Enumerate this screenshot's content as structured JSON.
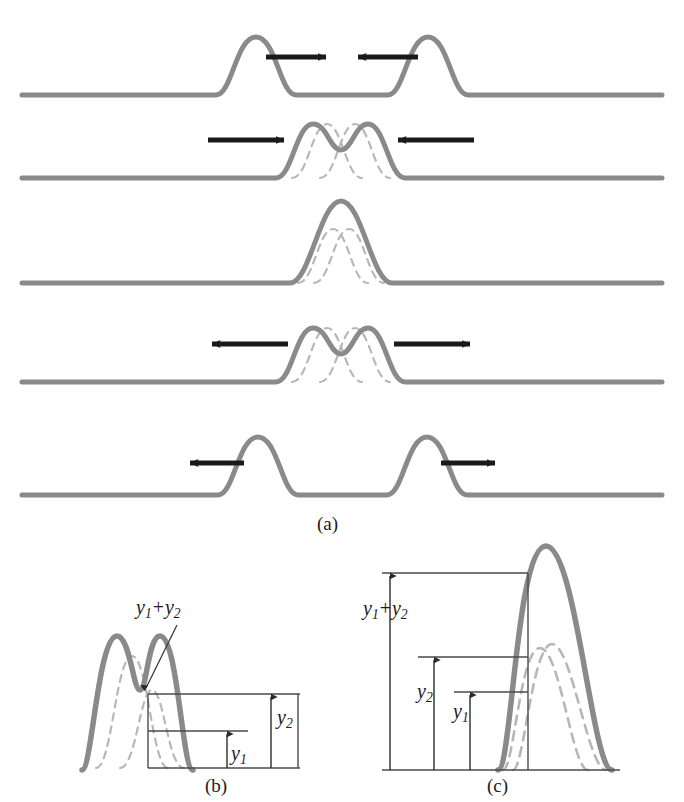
{
  "figure": {
    "colors": {
      "pulse": "#8a8a8a",
      "pulse_dashed": "#b3b3b3",
      "arrow": "#1a1a1a",
      "measure_line": "#4a4a4a",
      "text": "#1b1b1b",
      "background": "#ffffff"
    }
  },
  "panels": [
    {
      "id": "a",
      "label": "(a)",
      "caption_label": "(a)",
      "rows": [
        {
          "index": 1,
          "description": "Two separate pulses approaching each other",
          "baseline_y": 95,
          "pulses": [
            {
              "center": 256,
              "height": 58,
              "width": 62,
              "sign": "up"
            },
            {
              "center": 428,
              "height": 58,
              "width": 62,
              "sign": "up"
            }
          ],
          "arrows": [
            {
              "direction": "right",
              "x1": 266,
              "x2": 330,
              "y": 57
            },
            {
              "direction": "left",
              "x1": 418,
              "x2": 354,
              "y": 57
            }
          ],
          "ghost_pulses": []
        },
        {
          "index": 2,
          "description": "Pulses beginning to overlap; resultant has two humps",
          "baseline_y": 178,
          "pulses": [
            {
              "center": 313,
              "height": 54,
              "width": 58,
              "sign": "up"
            },
            {
              "center": 368,
              "height": 54,
              "width": 58,
              "sign": "up"
            }
          ],
          "arrows": [
            {
              "direction": "right",
              "x1": 208,
              "x2": 288,
              "y": 140
            },
            {
              "direction": "left",
              "x1": 474,
              "x2": 394,
              "y": 140
            }
          ],
          "ghost_pulses": [
            {
              "center": 327,
              "height": 54,
              "width": 58
            },
            {
              "center": 355,
              "height": 54,
              "width": 58
            }
          ]
        },
        {
          "index": 3,
          "description": "Pulses fully overlapped; resultant amplitude is the sum",
          "baseline_y": 283,
          "pulses": [
            {
              "center": 341,
              "height": 82,
              "width": 66,
              "sign": "up"
            }
          ],
          "arrows": [],
          "ghost_pulses": [
            {
              "center": 333,
              "height": 54,
              "width": 58
            },
            {
              "center": 349,
              "height": 54,
              "width": 58
            }
          ]
        },
        {
          "index": 4,
          "description": "Pulses separating again; resultant has two humps",
          "baseline_y": 382,
          "pulses": [
            {
              "center": 313,
              "height": 54,
              "width": 58,
              "sign": "up"
            },
            {
              "center": 368,
              "height": 54,
              "width": 58,
              "sign": "up"
            }
          ],
          "arrows": [
            {
              "direction": "left",
              "x1": 288,
              "x2": 208,
              "y": 344
            },
            {
              "direction": "right",
              "x1": 394,
              "x2": 474,
              "y": 344
            }
          ],
          "ghost_pulses": [
            {
              "center": 327,
              "height": 54,
              "width": 58
            },
            {
              "center": 355,
              "height": 54,
              "width": 58
            }
          ]
        },
        {
          "index": 5,
          "description": "Pulses have passed through one another, moving apart",
          "baseline_y": 495,
          "pulses": [
            {
              "center": 258,
              "height": 58,
              "width": 62,
              "sign": "up"
            },
            {
              "center": 427,
              "height": 58,
              "width": 62,
              "sign": "up"
            }
          ],
          "arrows": [
            {
              "direction": "left",
              "x1": 244,
              "x2": 186,
              "y": 463
            },
            {
              "direction": "right",
              "x1": 441,
              "x2": 499,
              "y": 463
            }
          ],
          "ghost_pulses": []
        }
      ]
    },
    {
      "id": "b",
      "label": "(b)",
      "caption_label": "(b)",
      "description": "Partially overlapping pulses; resultant displacement in the valley equals y1 + y2",
      "baseline_y": 768,
      "labels": {
        "sum": {
          "y": "y",
          "sub": "1",
          "op": "+",
          "y_b": "y",
          "sub_b": "2"
        },
        "y2": {
          "y": "y",
          "sub": "2"
        },
        "y1": {
          "y": "y",
          "sub": "1"
        }
      },
      "measure": {
        "y1_value_px": 36,
        "y2_value_px": 74,
        "sum_value_px": 110
      }
    },
    {
      "id": "c",
      "label": "(c)",
      "caption_label": "(c)",
      "description": "Fully overlapping pulses; resultant peak displacement equals y1 + y2",
      "baseline_y": 770,
      "labels": {
        "sum": {
          "y": "y",
          "sub": "1",
          "op": "+",
          "y_b": "y",
          "sub_b": "2"
        },
        "y2": {
          "y": "y",
          "sub": "2"
        },
        "y1": {
          "y": "y",
          "sub": "1"
        }
      },
      "measure": {
        "y1_value_px": 100,
        "y2_value_px": 123,
        "sum_value_px": 224
      }
    }
  ],
  "text": {
    "label_a": "(a)",
    "label_b": "(b)",
    "label_c": "(c)",
    "y1_plus_y2": "y1 + y2",
    "y1": "y1",
    "y2": "y2"
  }
}
